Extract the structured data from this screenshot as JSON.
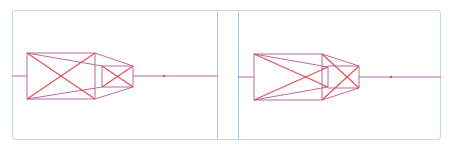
{
  "colors": {
    "border": "#c9d6dc",
    "divider": "#a9c4dc",
    "cross": "#e0505a",
    "edge": "#b86aa8",
    "axis": "#b86aa8"
  },
  "panels": [
    {
      "id": "left",
      "axis": {
        "y": 76,
        "x1": 12,
        "x2": 218
      },
      "dot": {
        "x": 164,
        "y": 76
      },
      "edges": [
        [
          27,
          53,
          95,
          53
        ],
        [
          95,
          53,
          95,
          99
        ],
        [
          95,
          99,
          27,
          99
        ],
        [
          27,
          99,
          27,
          53
        ],
        [
          102,
          66,
          133,
          66
        ],
        [
          133,
          66,
          133,
          87
        ],
        [
          133,
          87,
          102,
          87
        ],
        [
          102,
          87,
          102,
          66
        ],
        [
          95,
          53,
          133,
          66
        ],
        [
          95,
          99,
          133,
          87
        ],
        [
          27,
          53,
          102,
          66
        ],
        [
          27,
          99,
          102,
          87
        ],
        [
          12,
          76,
          27,
          76
        ],
        [
          133,
          76,
          218,
          76
        ]
      ],
      "crosses": [
        [
          27,
          53,
          95,
          99
        ],
        [
          27,
          99,
          95,
          53
        ],
        [
          102,
          66,
          133,
          87
        ],
        [
          102,
          87,
          133,
          66
        ]
      ]
    },
    {
      "id": "right",
      "axis": {
        "y": 77,
        "x1": 238,
        "x2": 441
      },
      "dot": {
        "x": 391,
        "y": 77
      },
      "edges": [
        [
          254,
          54,
          322,
          54
        ],
        [
          322,
          54,
          322,
          100
        ],
        [
          322,
          100,
          254,
          100
        ],
        [
          254,
          100,
          254,
          54
        ],
        [
          322,
          67,
          328,
          67
        ],
        [
          328,
          67,
          328,
          87
        ],
        [
          328,
          87,
          322,
          87
        ],
        [
          328,
          66,
          359,
          66
        ],
        [
          359,
          66,
          359,
          88
        ],
        [
          359,
          88,
          328,
          88
        ],
        [
          322,
          54,
          359,
          66
        ],
        [
          322,
          100,
          359,
          88
        ],
        [
          254,
          54,
          328,
          67
        ],
        [
          254,
          100,
          328,
          87
        ],
        [
          238,
          77,
          254,
          77
        ],
        [
          359,
          77,
          441,
          77
        ]
      ],
      "crosses": [
        [
          254,
          54,
          328,
          87
        ],
        [
          254,
          100,
          328,
          67
        ],
        [
          322,
          54,
          359,
          88
        ],
        [
          322,
          100,
          359,
          66
        ]
      ]
    }
  ]
}
